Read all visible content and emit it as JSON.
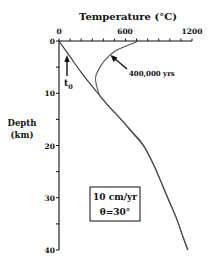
{
  "chart_data": {
    "type": "line",
    "title": "Temperature (°C)",
    "xlabel": "Temperature (°C)",
    "ylabel": "Depth (km)",
    "ylabel_lines": [
      "Depth",
      "(km)"
    ],
    "x_axis_position": "top",
    "y_axis_inverted": true,
    "xlim": [
      0,
      1200
    ],
    "ylim": [
      0,
      40
    ],
    "x_ticks": [
      0,
      100,
      200,
      300,
      400,
      500,
      600,
      700,
      800,
      900,
      1000,
      1100,
      1200
    ],
    "x_tick_labels": [
      "0",
      "600",
      "1200"
    ],
    "x_tick_label_values": [
      0,
      600,
      1200
    ],
    "y_ticks": [
      0,
      5,
      10,
      15,
      20,
      25,
      30,
      35,
      40
    ],
    "y_tick_labels": [
      "0",
      "10",
      "20",
      "30",
      "40"
    ],
    "y_tick_label_values": [
      0,
      10,
      20,
      30,
      40
    ],
    "grid": false,
    "legend": null,
    "series": [
      {
        "name": "t0",
        "label": "t0",
        "points": [
          [
            0,
            0
          ],
          [
            100,
            3
          ],
          [
            200,
            6
          ],
          [
            300,
            8.7
          ],
          [
            350,
            10
          ],
          [
            450,
            12.5
          ],
          [
            560,
            15
          ],
          [
            660,
            17.5
          ],
          [
            760,
            20
          ],
          [
            860,
            24
          ],
          [
            940,
            28
          ],
          [
            1000,
            31
          ],
          [
            1060,
            34
          ],
          [
            1110,
            37
          ],
          [
            1160,
            40
          ]
        ]
      },
      {
        "name": "400,000 yrs",
        "label": "400,000 yrs",
        "points": [
          [
            715,
            0
          ],
          [
            600,
            1
          ],
          [
            500,
            2
          ],
          [
            420,
            3.5
          ],
          [
            370,
            5
          ],
          [
            335,
            6.5
          ],
          [
            330,
            7.5
          ],
          [
            345,
            9
          ],
          [
            370,
            10.5
          ],
          [
            450,
            12.5
          ],
          [
            560,
            15
          ],
          [
            665,
            17.5
          ],
          [
            765,
            20
          ],
          [
            862,
            24
          ],
          [
            942,
            28
          ],
          [
            1002,
            31
          ],
          [
            1062,
            34
          ],
          [
            1112,
            37
          ],
          [
            1165,
            40
          ]
        ]
      }
    ],
    "annotations": [
      {
        "text": "t0",
        "subscript": "0",
        "arrow": "up",
        "x": 70,
        "y": 5
      },
      {
        "text": "400,000 yrs",
        "arrow_to_series": "400,000 yrs"
      },
      {
        "text_box": [
          "10 cm/yr",
          "θ=30°"
        ]
      }
    ]
  },
  "labels": {
    "title": "Temperature (°C)",
    "title_main": "Temperature (",
    "title_deg": "°C)",
    "x0": "0",
    "x600": "600",
    "x1200": "1200",
    "y0": "0",
    "y10": "10",
    "y20": "20",
    "y30": "30",
    "y40": "40",
    "ylabel_line1": "Depth",
    "ylabel_line2": "(km)",
    "t0_main": "t",
    "t0_sub": "0",
    "curve_label": "400,000 yrs",
    "box_line1": "10 cm/yr",
    "box_line2": "θ=30°"
  },
  "colors": {
    "axis": "#111111",
    "curve": "#444444",
    "background": "#ffffff"
  }
}
